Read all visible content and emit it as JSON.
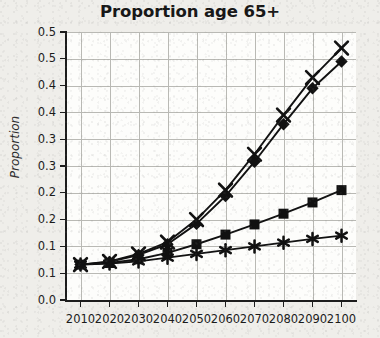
{
  "chart_data": {
    "type": "line",
    "title": "Proportion age 65+",
    "xlabel": "",
    "ylabel": "Proportion",
    "x": [
      2010,
      2020,
      2030,
      2040,
      2050,
      2060,
      2070,
      2080,
      2090,
      2100
    ],
    "xlim": [
      2005,
      2105
    ],
    "ylim": [
      0.0,
      0.5
    ],
    "ytick_values": [
      0.0,
      0.05,
      0.1,
      0.15,
      0.2,
      0.25,
      0.3,
      0.35,
      0.4,
      0.45,
      0.5
    ],
    "ytick_labels": [
      "0.0",
      "0.1",
      "0.1",
      "0.2",
      "0.2",
      "0.3",
      "0.3",
      "0.4",
      "0.4",
      "0.5",
      "0.5"
    ],
    "xtick_labels": [
      "2010",
      "2020",
      "2030",
      "2040",
      "2050",
      "2060",
      "2070",
      "2080",
      "2090",
      "2100"
    ],
    "grid": true,
    "legend": "none",
    "line_color": "#111111",
    "grid_color": "#b9b9b4",
    "series": [
      {
        "name": "series-cross",
        "marker": "cross",
        "values": [
          0.066,
          0.072,
          0.086,
          0.108,
          0.15,
          0.205,
          0.272,
          0.345,
          0.415,
          0.47
        ]
      },
      {
        "name": "series-diamond",
        "marker": "diamond",
        "values": [
          0.066,
          0.071,
          0.084,
          0.104,
          0.142,
          0.194,
          0.258,
          0.328,
          0.395,
          0.445
        ]
      },
      {
        "name": "series-square",
        "marker": "square",
        "values": [
          0.066,
          0.069,
          0.076,
          0.088,
          0.104,
          0.122,
          0.141,
          0.161,
          0.182,
          0.205
        ]
      },
      {
        "name": "series-star",
        "marker": "star",
        "values": [
          0.066,
          0.068,
          0.072,
          0.079,
          0.086,
          0.093,
          0.1,
          0.107,
          0.114,
          0.12
        ]
      }
    ]
  }
}
